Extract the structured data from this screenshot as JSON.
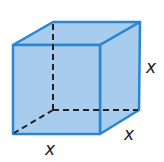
{
  "figure": {
    "shape": "cube",
    "fill_color": "#a8ccee",
    "edge_color": "#2a86d0",
    "hidden_edge_color": "#222222",
    "labels": {
      "height": "x",
      "width": "x",
      "depth": "x"
    }
  }
}
